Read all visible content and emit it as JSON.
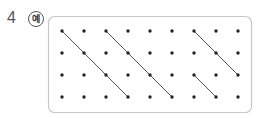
{
  "problem": {
    "number": "4",
    "example_label": "예"
  },
  "grid": {
    "cols": 9,
    "rows": 4,
    "x0": 62,
    "y0": 31,
    "spacing_x": 22,
    "spacing_y": 22,
    "box": {
      "x": 48,
      "y": 16,
      "w": 203,
      "h": 96,
      "r": 6,
      "stroke": "#c8c8c8"
    },
    "dot_color": "#222222",
    "line_color": "#555555",
    "segments": [
      {
        "from": [
          0,
          0
        ],
        "to": [
          3,
          3
        ]
      },
      {
        "from": [
          2,
          0
        ],
        "to": [
          5,
          3
        ]
      },
      {
        "from": [
          6,
          0
        ],
        "to": [
          8,
          2
        ]
      },
      {
        "from": [
          6,
          2
        ],
        "to": [
          7,
          3
        ]
      }
    ]
  }
}
